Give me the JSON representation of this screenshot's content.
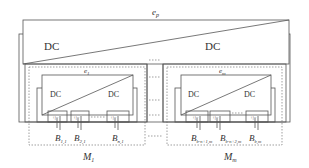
{
  "diagram": {
    "top_converter": {
      "label": "e_p",
      "label_main": "e",
      "label_sub": "p",
      "left_text": "DC",
      "right_text": "DC"
    },
    "modules": [
      {
        "name": "M_1",
        "name_main": "M",
        "name_sub": "1",
        "converter": {
          "label_main": "e",
          "label_sub": "1",
          "left_text": "DC",
          "right_text": "DC"
        },
        "batteries": [
          {
            "main": "B",
            "sub": "1,1",
            "polarity": "+|-"
          },
          {
            "main": "B",
            "sub": "2,1",
            "polarity": "+|-"
          },
          {
            "main": "B",
            "sub": "n,1",
            "polarity": "+|-"
          }
        ]
      },
      {
        "name": "M_m",
        "name_main": "M",
        "name_sub": "m",
        "converter": {
          "label_main": "e",
          "label_sub": "m",
          "left_text": "DC",
          "right_text": "DC"
        },
        "batteries": [
          {
            "main": "B",
            "sub": "b-n+1,m",
            "polarity": "+|-"
          },
          {
            "main": "B",
            "sub": "b-n+2,m",
            "polarity": "+|-"
          },
          {
            "main": "B",
            "sub": "b,m",
            "polarity": "+|-"
          }
        ]
      }
    ],
    "colors": {
      "line": "#555555",
      "dashed": "#777777",
      "text": "#333333"
    }
  }
}
